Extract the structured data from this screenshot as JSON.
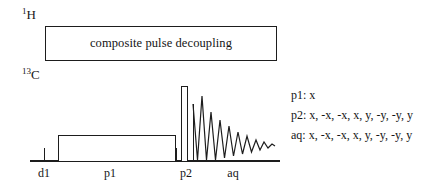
{
  "figure": {
    "type": "nmr-pulse-sequence",
    "width": 445,
    "height": 194,
    "line_color": "#1d1d1d",
    "background": "#ffffff"
  },
  "channels": [
    {
      "id": "proton",
      "mass_number": "1",
      "element": "H",
      "label_x": 22,
      "label_y": 8
    },
    {
      "id": "carbon",
      "mass_number": "13",
      "element": "C",
      "label_x": 22,
      "label_y": 68
    }
  ],
  "decoupling": {
    "text": "composite pulse decoupling",
    "x": 45,
    "y": 26,
    "width": 232,
    "height": 35
  },
  "carbon_axis": {
    "baseline_x": 30,
    "baseline_y": 160,
    "baseline_width": 250
  },
  "pulses": [
    {
      "name": "p1",
      "x": 58,
      "width": 118,
      "top": 135,
      "height": 26
    },
    {
      "name": "p2",
      "x": 181,
      "width": 7,
      "top": 86,
      "height": 75
    }
  ],
  "acquisition_marker": {
    "x": 193,
    "top": 104,
    "height": 57
  },
  "axis_ticks": [
    {
      "name": "d1-start",
      "x": 44,
      "top": 148,
      "height": 13
    },
    {
      "name": "p1-end",
      "x": 176,
      "top": 148,
      "height": 13
    },
    {
      "name": "aq-start",
      "x": 193,
      "top": 148,
      "height": 13
    }
  ],
  "interval_labels": [
    {
      "name": "d1",
      "text": "d1",
      "center_x": 44,
      "y": 166
    },
    {
      "name": "p1",
      "text": "p1",
      "center_x": 110,
      "y": 166
    },
    {
      "name": "p2",
      "text": "p2",
      "center_x": 186,
      "y": 166
    },
    {
      "name": "aq",
      "text": "aq",
      "center_x": 233,
      "y": 166
    }
  ],
  "fid": {
    "name": "free-induction-decay",
    "x": 193,
    "y": 96,
    "width": 82,
    "height": 66,
    "baseline_y": 64,
    "path": "M 0,8 L 4.5,64 L 9,0 L 13.5,64 L 18,16 L 22.5,64 L 27,24 L 31.5,62 L 36,30 L 40.5,60 L 45,36 L 49.5,58 L 54,40 L 58.5,56 L 63,44 L 67,54 L 71,46 L 75,52 L 79,48 L 82,50"
  },
  "phase_cycling": [
    {
      "name": "p1",
      "text": "p1: x"
    },
    {
      "name": "p2",
      "text": "p2: x, -x, -x, x, y, -y, -y, y"
    },
    {
      "name": "aq",
      "text": "aq: x, -x, -x, x, y, -y, -y, y"
    }
  ]
}
